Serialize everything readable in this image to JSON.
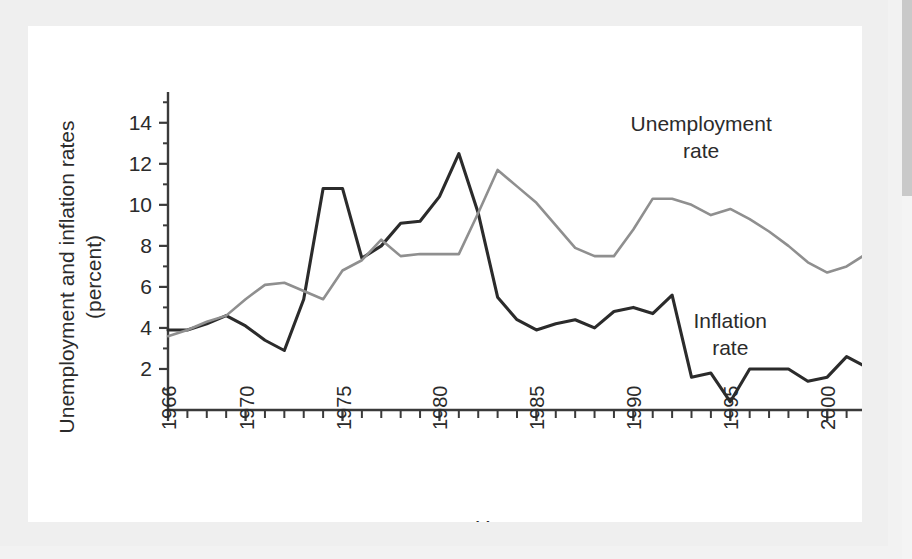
{
  "figure": {
    "background_color": "#efefef",
    "card_color": "#ffffff"
  },
  "chart_data": {
    "type": "line",
    "title": "",
    "xlabel": "Year",
    "ylabel": "Unemployment and inflation rates (percent)",
    "ylabel_line1": "Unemployment and inflation rates",
    "ylabel_line2": "(percent)",
    "xlim": [
      1966,
      2002
    ],
    "ylim": [
      0,
      15.5
    ],
    "yticks": [
      2,
      4,
      6,
      8,
      10,
      12,
      14
    ],
    "ytick_labels": [
      "2",
      "4",
      "6",
      "8",
      "10",
      "12",
      "14"
    ],
    "xticks": [
      1966,
      1970,
      1975,
      1980,
      1985,
      1990,
      1995,
      2000
    ],
    "xtick_labels": [
      "1966",
      "1970",
      "1975",
      "1980",
      "1985",
      "1990",
      "1995",
      "2000"
    ],
    "xtick_minor_every": 1,
    "grid": false,
    "legend_position": "inline-annotations",
    "x": [
      1966,
      1967,
      1968,
      1969,
      1970,
      1971,
      1972,
      1973,
      1974,
      1975,
      1976,
      1977,
      1978,
      1979,
      1980,
      1981,
      1982,
      1983,
      1984,
      1985,
      1986,
      1987,
      1988,
      1989,
      1990,
      1991,
      1992,
      1993,
      1994,
      1995,
      1996,
      1997,
      1998,
      1999,
      2000,
      2001,
      2002
    ],
    "series": [
      {
        "name": "Inflation rate",
        "color": "#2b2b2b",
        "label_line1": "Inflation",
        "label_line2": "rate",
        "values": [
          3.9,
          3.9,
          4.2,
          4.6,
          4.1,
          3.4,
          2.9,
          5.4,
          10.8,
          10.8,
          7.4,
          8.0,
          9.1,
          9.2,
          10.4,
          12.5,
          9.6,
          5.5,
          4.4,
          3.9,
          4.2,
          4.4,
          4.0,
          4.8,
          5.0,
          4.7,
          5.6,
          1.6,
          1.8,
          0.4,
          2.0,
          2.0,
          2.0,
          1.4,
          1.6,
          2.6,
          2.1
        ]
      },
      {
        "name": "Unemployment rate",
        "color": "#8f8f8f",
        "label_line1": "Unemployment",
        "label_line2": "rate",
        "values": [
          3.6,
          3.9,
          4.3,
          4.6,
          5.4,
          6.1,
          6.2,
          5.8,
          5.4,
          6.8,
          7.3,
          8.3,
          7.5,
          7.6,
          7.6,
          7.6,
          9.6,
          11.7,
          10.9,
          10.1,
          9.0,
          7.9,
          7.5,
          7.5,
          8.8,
          10.3,
          10.3,
          10.0,
          9.5,
          9.8,
          9.3,
          8.7,
          8.0,
          7.2,
          6.7,
          7.0,
          7.6
        ]
      }
    ],
    "annotations": [
      {
        "text": "Unemployment rate",
        "x": 1993.5,
        "y": 13.6,
        "color": "#2b2b2b"
      },
      {
        "text": "Inflation rate",
        "x": 1995.0,
        "y": 4.0,
        "color": "#2b2b2b"
      }
    ]
  }
}
